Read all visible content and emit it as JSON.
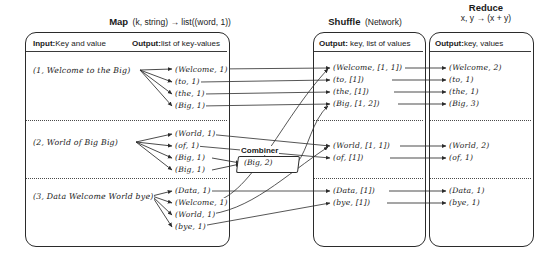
{
  "diagram": {
    "phases": [
      {
        "name": "Map",
        "signature": "(k, string) → list((word, 1))"
      },
      {
        "name": "Shuffle",
        "signature": "(Network)"
      },
      {
        "name": "Reduce",
        "signature": "x, y → (x + y)"
      }
    ],
    "columns": {
      "input": {
        "label_bold": "Input:",
        "label_rest": "Key and value"
      },
      "map_output": {
        "label_bold": "Output:",
        "label_rest": "list of key-values"
      },
      "shuffle_output": {
        "label_bold": "Output:",
        "label_rest": " key, list of values"
      },
      "reduce_output": {
        "label_bold": "Output:",
        "label_rest": "key, values"
      }
    },
    "combiner": {
      "label": "Combiner",
      "record": "(Big, 2)"
    },
    "groups": [
      {
        "input": "(1, Welcome to the Big)",
        "map_output": [
          "(Welcome, 1)",
          "(to, 1)",
          "(the, 1)",
          "(Big, 1)"
        ],
        "shuffle_output": [
          "(Welcome, [1, 1])",
          "(to, [1])",
          "(the, [1])",
          "(Big, [1, 2])"
        ],
        "reduce_output": [
          "(Welcome, 2)",
          "(to, 1)",
          "(the, 1)",
          "(Big, 3)"
        ]
      },
      {
        "input": "(2, World of Big Big)",
        "map_output": [
          "(World, 1)",
          "(of, 1)",
          "(Big, 1)",
          "(Big, 1)"
        ],
        "shuffle_output": [
          "(World, [1, 1])",
          "(of, [1])"
        ],
        "reduce_output": [
          "(World, 2)",
          "(of, 1)"
        ]
      },
      {
        "input": "(3, Data Welcome World bye)",
        "map_output": [
          "(Data, 1)",
          "(Welcome, 1)",
          "(World, 1)",
          "(bye, 1)"
        ],
        "shuffle_output": [
          "(Data, [1])",
          "(bye, [1])"
        ],
        "reduce_output": [
          "(Data, 1)",
          "(bye, 1)"
        ]
      }
    ],
    "colors": {
      "ink": "#1a1a1a",
      "stroke": "#2b2b2b",
      "separator": "#4a4a4a"
    }
  }
}
